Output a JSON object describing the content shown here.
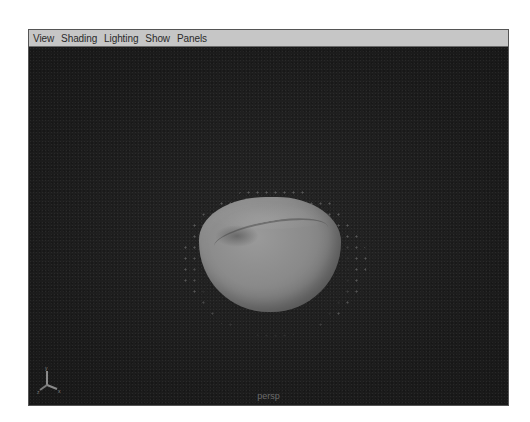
{
  "panel": {
    "menu": [
      {
        "label": "View"
      },
      {
        "label": "Shading"
      },
      {
        "label": "Lighting"
      },
      {
        "label": "Show"
      },
      {
        "label": "Panels"
      }
    ]
  },
  "viewport": {
    "camera_label": "persp",
    "axis_indicator": {
      "icon": "axis-gizmo-icon",
      "axes": [
        "Y",
        "Z",
        "X"
      ]
    },
    "object": {
      "icon": "bowl-mesh",
      "description": "soft-body bowl mesh with particle points"
    }
  },
  "colors": {
    "menubar_bg": "#c6c6c6",
    "viewport_bg": "#1e1e1e",
    "object": "#8a8a8a"
  }
}
